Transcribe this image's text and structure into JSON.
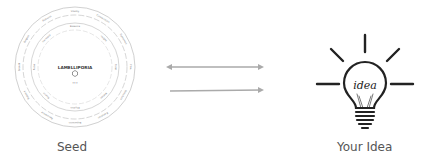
{
  "seed": {
    "caption": "Seed",
    "wheel": {
      "center_title": "LAMELLIPORIA",
      "center_subtitle": "•••",
      "outer_ring_labels": [
        "Vitality",
        "Connections",
        "Dynamics",
        "Flow",
        "Structure",
        "Evolution",
        "Expansion",
        "Resonance",
        "Balance",
        "Growth",
        "Origins",
        "Patterns"
      ],
      "inner_ring_labels": [
        "Essence",
        "Insight",
        "Form",
        "Motion",
        "Rhythm",
        "Source",
        "Pulse",
        "Harmony"
      ]
    },
    "line_color": "#999999"
  },
  "arrows": {
    "top": {
      "type": "bidirectional"
    },
    "bottom": {
      "type": "forward"
    },
    "color": "#aaaaaa"
  },
  "idea": {
    "caption": "Your Idea",
    "bulb_text": "idea",
    "color": "#222222"
  }
}
